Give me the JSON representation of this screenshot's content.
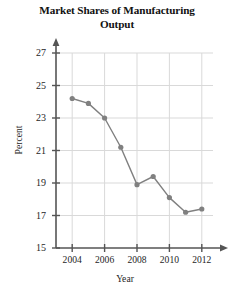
{
  "chart_data": {
    "type": "line",
    "title": "Market Shares of Manufacturing Output",
    "title_line1": "Market Shares of Manufacturing",
    "title_line2": "Output",
    "xlabel": "Year",
    "ylabel": "Percent",
    "x": [
      2004,
      2005,
      2006,
      2007,
      2008,
      2009,
      2010,
      2011,
      2012
    ],
    "values": [
      24.2,
      23.9,
      23.0,
      21.2,
      18.9,
      19.4,
      18.1,
      17.2,
      17.4
    ],
    "xlim": [
      2003,
      2013
    ],
    "ylim": [
      15,
      27
    ],
    "x_ticks": [
      2004,
      2006,
      2008,
      2010,
      2012
    ],
    "x_tick_labels": [
      "2004",
      "2006",
      "2008",
      "2010",
      "2012"
    ],
    "y_ticks": [
      15,
      17,
      19,
      21,
      23,
      25,
      27
    ],
    "y_tick_labels": [
      "15",
      "17",
      "19",
      "21",
      "23",
      "25",
      "27"
    ],
    "grid": true,
    "legend": "none",
    "marker": "circle",
    "series_color": "#808080",
    "grid_color": "#d9d9d9",
    "axis_color": "#4d4d4d"
  },
  "axis": {
    "y_title": "Percent",
    "x_title": "Year"
  }
}
